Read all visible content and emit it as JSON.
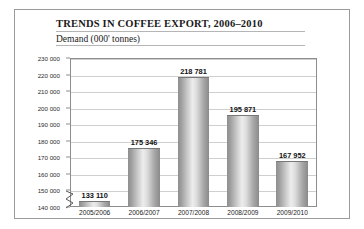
{
  "chart_data": {
    "type": "bar",
    "title": "TRENDS IN COFFEE EXPORT, 2006–2010",
    "subtitle": "Demand (000' tonnes)",
    "xlabel": "",
    "ylabel": "Demand (000' tonnes)",
    "categories": [
      "2005/2006",
      "2006/2007",
      "2007/2008",
      "2008/2009",
      "2009/2010"
    ],
    "values": [
      133110,
      175346,
      218781,
      195871,
      167952
    ],
    "value_labels": [
      "133 110",
      "175 346",
      "218 781",
      "195 871",
      "167 952"
    ],
    "ylim": [
      140000,
      230000
    ],
    "yticks": [
      140000,
      150000,
      160000,
      170000,
      180000,
      190000,
      200000,
      210000,
      220000,
      230000
    ],
    "ytick_labels": [
      "140 000",
      "150 000",
      "160 000",
      "170 000",
      "180 000",
      "190 000",
      "200 000",
      "210 000",
      "220 000",
      "230 000"
    ],
    "axis_break": true,
    "axis_break_note": "y-axis broken below 140 000",
    "grid": true,
    "legend": false,
    "colors": {
      "bar_light": "#ededed",
      "bar_dark": "#8a8a8a",
      "gridline": "#cfcfcf",
      "frame": "#8d8d8d",
      "text": "#1a1a1a"
    }
  }
}
